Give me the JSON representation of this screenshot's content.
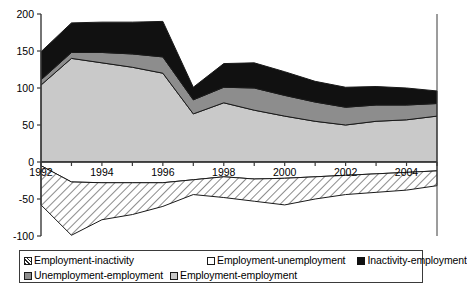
{
  "chart_data": {
    "type": "area",
    "title": "",
    "subtitle": "",
    "xlabel": "",
    "ylabel": "",
    "stacked": true,
    "grid": false,
    "legend_position": "bottom",
    "xlim": [
      1992,
      2005
    ],
    "ylim": [
      -100,
      200
    ],
    "yticks": [
      -100,
      -50,
      0,
      50,
      100,
      150,
      200
    ],
    "ytick_labels": [
      "-100",
      "-50",
      "0",
      "50",
      "100",
      "150",
      "200"
    ],
    "xticks": [
      1992,
      1993,
      1994,
      1995,
      1996,
      1997,
      1998,
      1999,
      2000,
      2001,
      2002,
      2003,
      2004,
      2005
    ],
    "xtick_labels_shown": [
      "1992",
      "1994",
      "1996",
      "1998",
      "2000",
      "2002",
      "2004"
    ],
    "x": [
      1992,
      1993,
      1994,
      1995,
      1996,
      1997,
      1998,
      1999,
      2000,
      2001,
      2002,
      2003,
      2004,
      2005
    ],
    "series": [
      {
        "name": "Employment-employment",
        "fill": "light-gray",
        "color": "#c9c9c9",
        "sign": "positive",
        "values": [
          104,
          140,
          134,
          128,
          120,
          65,
          80,
          70,
          62,
          55,
          50,
          55,
          57,
          62
        ]
      },
      {
        "name": "Unemployment-employment",
        "fill": "dark-gray",
        "color": "#8d8d8d",
        "sign": "positive",
        "values": [
          7,
          8,
          14,
          18,
          22,
          19,
          21,
          30,
          28,
          26,
          24,
          22,
          20,
          17
        ]
      },
      {
        "name": "Inactivity-employment",
        "fill": "black",
        "color": "#111111",
        "sign": "positive",
        "values": [
          38,
          40,
          41,
          43,
          48,
          17,
          32,
          34,
          32,
          28,
          27,
          25,
          23,
          17
        ]
      },
      {
        "name": "Employment-unemployment",
        "fill": "white",
        "color": "#ffffff",
        "sign": "negative",
        "values": [
          -5,
          -27,
          -28,
          -28,
          -28,
          -24,
          -20,
          -23,
          -22,
          -20,
          -18,
          -16,
          -14,
          -12
        ]
      },
      {
        "name": "Employment-inactivity",
        "fill": "hatch",
        "color": "#2b2b2b",
        "sign": "negative",
        "values": [
          -53,
          -72,
          -50,
          -43,
          -32,
          -20,
          -28,
          -30,
          -36,
          -30,
          -26,
          -25,
          -24,
          -20
        ]
      }
    ],
    "legend_entries": [
      {
        "label": "Employment-inactivity",
        "swatch": "hatch"
      },
      {
        "label": "Employment-unemployment",
        "swatch": "white"
      },
      {
        "label": "Inactivity-employment",
        "swatch": "black"
      },
      {
        "label": "Unemployment-employment",
        "swatch": "dark-gray"
      },
      {
        "label": "Employment-employment",
        "swatch": "light-gray"
      }
    ],
    "colors": {
      "light_gray": "#c9c9c9",
      "dark_gray": "#8d8d8d",
      "black": "#111111",
      "white": "#ffffff",
      "hatch_stroke": "#2b2b2b",
      "axis": "#3a3a3a",
      "outline": "#1a1a1a",
      "legend_border": "#3a3a3a"
    }
  }
}
